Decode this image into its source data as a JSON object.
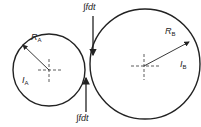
{
  "diagram": {
    "circle_a": {
      "radius_label": "R",
      "radius_sub": "A",
      "inertia_label": "I",
      "inertia_sub": "A"
    },
    "circle_b": {
      "radius_label": "R",
      "radius_sub": "B",
      "inertia_label": "I",
      "inertia_sub": "B"
    },
    "impulse_top": "∫fdt",
    "impulse_bottom": "∫fdt",
    "line_color": "#222222"
  }
}
